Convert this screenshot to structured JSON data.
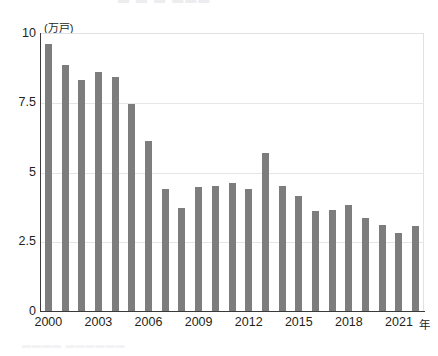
{
  "artifacts": {
    "top_clipped_text": "▬ ▬ ▬ ▬▬▬",
    "bottom_clipped_text": "▬▬▬▬ ▬▬▬▬▬▬"
  },
  "chart_data": {
    "type": "bar",
    "title": "",
    "subtitle": "",
    "xlabel": "年",
    "ylabel": "",
    "unit_label": "(万戸)",
    "categories": [
      "2000",
      "2001",
      "2002",
      "2003",
      "2004",
      "2005",
      "2006",
      "2007",
      "2008",
      "2009",
      "2010",
      "2011",
      "2012",
      "2013",
      "2014",
      "2015",
      "2016",
      "2017",
      "2018",
      "2019",
      "2020",
      "2021",
      "2022"
    ],
    "values": [
      9.6,
      8.85,
      8.3,
      8.6,
      8.4,
      7.45,
      6.1,
      4.4,
      3.7,
      4.45,
      4.5,
      4.6,
      4.4,
      5.7,
      4.5,
      4.15,
      3.6,
      3.65,
      3.8,
      3.35,
      3.1,
      2.8,
      3.05
    ],
    "x_tick_labels": [
      "2000",
      "2003",
      "2006",
      "2009",
      "2012",
      "2015",
      "2018",
      "2021"
    ],
    "x_tick_categories": [
      "2000",
      "2003",
      "2006",
      "2009",
      "2012",
      "2015",
      "2018",
      "2021"
    ],
    "y_tick_labels": [
      "0",
      "2.5",
      "5",
      "7.5",
      "10"
    ],
    "y_tick_values": [
      0,
      2.5,
      5,
      7.5,
      10
    ],
    "ylim": [
      0,
      10
    ],
    "grid": "horizontal",
    "legend": "none",
    "bar_color": "#7d7d7d",
    "gridline_color": "#e6e6e8",
    "axis_color": "#3a3a3a"
  }
}
